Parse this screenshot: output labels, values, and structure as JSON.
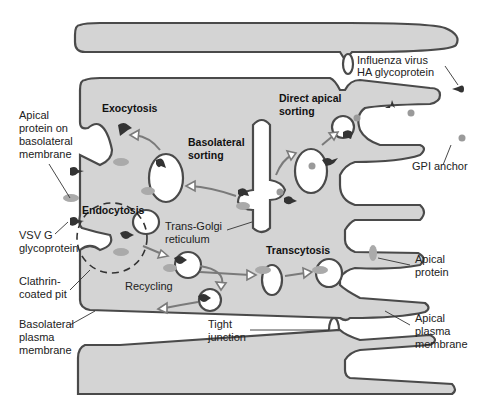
{
  "diagram": {
    "type": "cell-biology-illustration",
    "colors": {
      "cytoplasm": "#d4d4d4",
      "membrane": "#4a4a4a",
      "vesicle_lumen": "#ffffff",
      "dark_protein": "#333333",
      "pale_protein": "#aaaaaa",
      "arrow": "#7a7a7a"
    },
    "process_labels": {
      "exocytosis": "Exocytosis",
      "basolateral_sorting_1": "Basolateral",
      "basolateral_sorting_2": "sorting",
      "direct_apical_1": "Direct apical",
      "direct_apical_2": "sorting",
      "endocytosis": "Endocytosis",
      "transcytosis": "Transcytosis",
      "recycling": "Recycling"
    },
    "callouts": {
      "apical_on_basolateral_1": "Apical",
      "apical_on_basolateral_2": "protein on",
      "apical_on_basolateral_3": "basolateral",
      "apical_on_basolateral_4": "membrane",
      "influenza_1": "Influenza virus",
      "influenza_2": "HA glycoprotein",
      "gpi": "GPI anchor",
      "vsv_1": "VSV G",
      "vsv_2": "glycoprotein",
      "tgn_1": "Trans-Golgi",
      "tgn_2": "reticulum",
      "clathrin_1": "Clathrin-",
      "clathrin_2": "coated pit",
      "basolateral_pm_1": "Basolateral",
      "basolateral_pm_2": "plasma",
      "basolateral_pm_3": "membrane",
      "tight_1": "Tight",
      "tight_2": "junction",
      "apical_protein_1": "Apical",
      "apical_protein_2": "protein",
      "apical_pm_1": "Apical",
      "apical_pm_2": "plasma",
      "apical_pm_3": "membrane"
    }
  }
}
